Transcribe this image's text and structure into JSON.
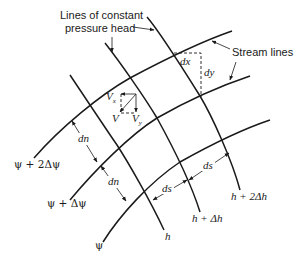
{
  "diagram": {
    "type": "flow-net",
    "annotations": {
      "pressure_head_label_line1": "Lines of constant",
      "pressure_head_label_line2": "pressure head",
      "stream_lines_label": "Stream lines"
    },
    "stream_lines": [
      {
        "label": "ψ + 2Δψ"
      },
      {
        "label": "ψ + Δψ"
      },
      {
        "label": "ψ"
      }
    ],
    "equipotential_lines": [
      {
        "label": "h"
      },
      {
        "label": "h + Δh"
      },
      {
        "label": "h + 2Δh"
      }
    ],
    "dimensions": {
      "dn_1": "dn",
      "dn_2": "dn",
      "ds_1": "ds",
      "ds_2": "ds",
      "dx": "dx",
      "dy": "dy"
    },
    "velocity": {
      "v": "V",
      "vx": "V",
      "vx_sub": "x",
      "vy": "V",
      "vy_sub": "y"
    },
    "colors": {
      "ink": "#1a1a1a",
      "background": "#ffffff"
    }
  }
}
